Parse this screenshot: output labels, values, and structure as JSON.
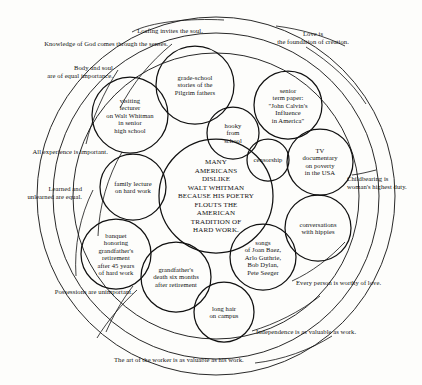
{
  "diagram": {
    "title_text": "MANY\nAMERICANS\nDISLIKE\nWALT WHITMAN\nBECAUSE HIS POETRY\nFLOUTS THE\nAMERICAN\nTRADITION  OF\nHARD WORK.",
    "ink_color": "#111111",
    "background_color": "#fdfdfb",
    "inner_bubbles": [
      {
        "label": "grade-school\nstories of the\nPilgrim fathers",
        "cx": 195,
        "cy": 85,
        "r": 39
      },
      {
        "label": "visiting\nlecturer\non Walt Whitman\nin senior\nhigh school",
        "cx": 130,
        "cy": 115,
        "r": 38
      },
      {
        "label": "senior\nterm paper:\n\"John Calvin's\nInfluence\nin America\"",
        "cx": 288,
        "cy": 105,
        "r": 34
      },
      {
        "label": "hooky\nfrom\nschool",
        "cx": 233,
        "cy": 133,
        "r": 26
      },
      {
        "label": "censorship",
        "cx": 268,
        "cy": 160,
        "r": 21
      },
      {
        "label": "TV\ndocumentary\non poverty\nin the USA",
        "cx": 320,
        "cy": 162,
        "r": 33
      },
      {
        "label": "family lecture\non hard work",
        "cx": 133,
        "cy": 187,
        "r": 33
      },
      {
        "label": "conversations\nwith hippies",
        "cx": 318,
        "cy": 228,
        "r": 33
      },
      {
        "label": "banquet\nhonoring\ngrandfather's\nretirement\nafter 45 years\nof hard work",
        "cx": 116,
        "cy": 254,
        "r": 35
      },
      {
        "label": "songs\nof Joan Baez,\nArlo Guthrie,\nBob Dylan,\nPete Seeger",
        "cx": 263,
        "cy": 257,
        "r": 33
      },
      {
        "label": "grandfather's\ndeath six months\nafter retirement",
        "cx": 176,
        "cy": 277,
        "r": 35
      },
      {
        "label": "long hair\non campus",
        "cx": 224,
        "cy": 312,
        "r": 30
      }
    ],
    "center_bubble": {
      "cx": 216,
      "cy": 196,
      "r": 57
    },
    "rings": [
      {
        "name": "outer-ring",
        "cx": 216,
        "cy": 196,
        "r": 179
      },
      {
        "name": "middle-ring",
        "cx": 216,
        "cy": 196,
        "r": 163
      },
      {
        "name": "inner-ring",
        "cx": 216,
        "cy": 196,
        "r": 143
      }
    ],
    "ring_labels": [
      {
        "text": "Loafing invites the soul.",
        "x": 170,
        "y": 31,
        "align": "center",
        "name": "ring-label-loafing"
      },
      {
        "text": "Love is\nthe foundation of creation.",
        "x": 313,
        "y": 38,
        "align": "center",
        "name": "ring-label-love"
      },
      {
        "text": "Knowledge of God comes through the senses.",
        "x": 168,
        "y": 44,
        "align": "right",
        "name": "ring-label-knowledge"
      },
      {
        "text": "Body and soul\nare of equal importance.",
        "x": 113,
        "y": 72,
        "align": "right",
        "name": "ring-label-body-soul"
      },
      {
        "text": "All experience is important.",
        "x": 108,
        "y": 152,
        "align": "right",
        "name": "ring-label-experience"
      },
      {
        "text": "Learned and\nunlearned are equal.",
        "x": 82,
        "y": 193,
        "align": "right",
        "name": "ring-label-learned"
      },
      {
        "text": "Possessions are unimportant.",
        "x": 133,
        "y": 292,
        "align": "right",
        "name": "ring-label-possessions"
      },
      {
        "text": "The art of the worker is as valuable as his work.",
        "x": 114,
        "y": 360,
        "align": "left",
        "name": "ring-label-art-worker"
      },
      {
        "text": "Independence is as valuable as work.",
        "x": 256,
        "y": 332,
        "align": "left",
        "name": "ring-label-independence"
      },
      {
        "text": "Every person is worthy of love.",
        "x": 296,
        "y": 283,
        "align": "left",
        "name": "ring-label-every-person"
      },
      {
        "text": "Childbearing is\nwoman's highest duty.",
        "x": 347,
        "y": 183,
        "align": "left",
        "name": "ring-label-childbearing"
      }
    ]
  }
}
